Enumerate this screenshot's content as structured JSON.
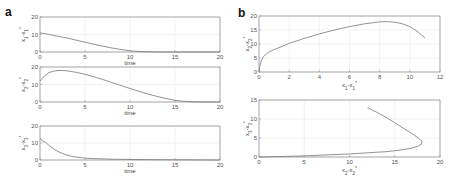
{
  "panels": {
    "a": "a",
    "b": "b"
  },
  "chart_data": [
    {
      "id": "a1",
      "panel": "a",
      "type": "line",
      "ylabel": "x1 - x1*",
      "xlabel": "time",
      "xlim": [
        0,
        20
      ],
      "ylim": [
        0,
        20
      ],
      "xticks": [
        0,
        5,
        10,
        15,
        20
      ],
      "yticks": [
        0,
        10,
        20
      ],
      "grid": true,
      "x": [
        0,
        1,
        2,
        3,
        4,
        5,
        6,
        7,
        8,
        9,
        10,
        11,
        12,
        13,
        14,
        15,
        20
      ],
      "y": [
        11,
        10,
        9,
        8,
        6.8,
        5.6,
        4.4,
        3.3,
        2.3,
        1.4,
        0.7,
        0.3,
        0.1,
        0.03,
        0,
        0,
        0
      ]
    },
    {
      "id": "a2",
      "panel": "a",
      "type": "line",
      "ylabel": "x2 - x2*",
      "xlabel": "time",
      "xlim": [
        0,
        20
      ],
      "ylim": [
        0,
        20
      ],
      "xticks": [
        0,
        5,
        10,
        15,
        20
      ],
      "yticks": [
        0,
        10,
        20
      ],
      "grid": true,
      "x": [
        0,
        0.5,
        1,
        1.5,
        2,
        2.5,
        3,
        4,
        5,
        6,
        7,
        8,
        9,
        10,
        11,
        12,
        13,
        14,
        15,
        16,
        17,
        18,
        20
      ],
      "y": [
        12,
        15,
        16.8,
        17.6,
        18,
        18,
        17.8,
        17,
        15.8,
        14.4,
        12.8,
        11.1,
        9.4,
        7.7,
        6.1,
        4.6,
        3.2,
        2,
        1,
        0.4,
        0.1,
        0,
        0
      ]
    },
    {
      "id": "a3",
      "panel": "a",
      "type": "line",
      "ylabel": "x3 - x3*",
      "xlabel": "time",
      "xlim": [
        0,
        20
      ],
      "ylim": [
        0,
        20
      ],
      "xticks": [
        0,
        5,
        10,
        15,
        20
      ],
      "yticks": [
        0,
        10,
        20
      ],
      "grid": true,
      "x": [
        0,
        0.3,
        0.6,
        1,
        1.5,
        2,
        2.5,
        3,
        3.5,
        4,
        5,
        6,
        8,
        10,
        15,
        20
      ],
      "y": [
        13,
        11,
        10.5,
        8.6,
        6.6,
        5,
        3.8,
        2.9,
        2.2,
        1.7,
        1.1,
        0.8,
        0.5,
        0.3,
        0.1,
        0
      ]
    },
    {
      "id": "b1",
      "panel": "b",
      "type": "line",
      "ylabel": "x2 - x2*",
      "xlabel": "x1 - x1*",
      "xlim": [
        0,
        12
      ],
      "ylim": [
        0,
        20
      ],
      "xticks": [
        0,
        2,
        4,
        6,
        8,
        10,
        12
      ],
      "yticks": [
        0,
        5,
        10,
        15,
        20
      ],
      "grid": true,
      "x": [
        0,
        0.05,
        0.15,
        0.3,
        0.6,
        1,
        2,
        3,
        4,
        5,
        6,
        7,
        8,
        8.5,
        9,
        9.5,
        10,
        10.5,
        11
      ],
      "y": [
        0,
        2,
        4,
        5.5,
        7,
        8,
        10.2,
        12,
        13.6,
        15,
        16.2,
        17.2,
        17.9,
        18,
        17.8,
        17.2,
        16.2,
        14.5,
        12.2
      ]
    },
    {
      "id": "b2",
      "panel": "b",
      "type": "line",
      "ylabel": "x3 - x3*",
      "xlabel": "x2 - x2*",
      "xlim": [
        0,
        20
      ],
      "ylim": [
        0,
        15
      ],
      "xticks": [
        0,
        5,
        10,
        15,
        20
      ],
      "yticks": [
        0,
        5,
        10,
        15
      ],
      "grid": true,
      "x": [
        0,
        2,
        5,
        8,
        10,
        12,
        14,
        15.5,
        16.8,
        17.6,
        18,
        18,
        17.6,
        17,
        16,
        15,
        14,
        13,
        12
      ],
      "y": [
        0,
        0.1,
        0.3,
        0.6,
        0.8,
        1.1,
        1.4,
        1.8,
        2.3,
        2.9,
        3.5,
        4.2,
        5,
        6,
        7.5,
        9,
        10.5,
        11.8,
        13
      ]
    }
  ]
}
